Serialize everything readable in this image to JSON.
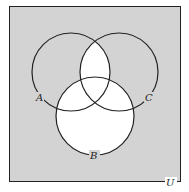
{
  "diagram": {
    "type": "venn",
    "universe_label": "U",
    "sets": [
      {
        "name": "A",
        "label": "A"
      },
      {
        "name": "B",
        "label": "B"
      },
      {
        "name": "C",
        "label": "C"
      }
    ],
    "shaded_region": "complement of (B ∪ (A ∩ C))",
    "unshaded_regions": [
      "B",
      "A ∩ C"
    ],
    "colors": {
      "shade": "#d3d3d3",
      "unshaded": "#ffffff",
      "stroke": "#222222"
    }
  }
}
